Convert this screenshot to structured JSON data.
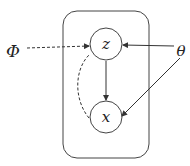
{
  "diagram": {
    "type": "graphical-model-plate",
    "plate": {
      "x": 63,
      "y": 11,
      "width": 86,
      "height": 147,
      "radius": 14
    },
    "nodes": [
      {
        "id": "z",
        "label": "z",
        "cx": 106,
        "cy": 44,
        "r": 16
      },
      {
        "id": "x",
        "label": "x",
        "cx": 106,
        "cy": 117,
        "r": 16
      }
    ],
    "params": [
      {
        "id": "phi",
        "label": "Φ",
        "x": 13,
        "y": 52
      },
      {
        "id": "theta",
        "label": "θ",
        "x": 180,
        "y": 51
      }
    ],
    "edges": [
      {
        "from": "phi",
        "to": "z",
        "style": "dashed"
      },
      {
        "from": "theta",
        "to": "z",
        "style": "solid"
      },
      {
        "from": "theta",
        "to": "x",
        "style": "solid"
      },
      {
        "from": "z",
        "to": "x",
        "style": "solid"
      },
      {
        "from": "x",
        "to": "z",
        "style": "dashed-curved"
      }
    ],
    "colors": {
      "stroke": "#333333",
      "background": "#ffffff"
    }
  }
}
